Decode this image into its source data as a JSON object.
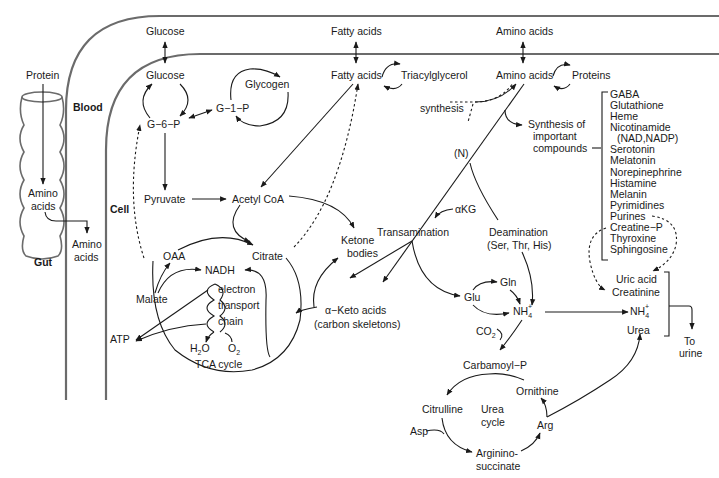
{
  "compartments": {
    "blood": "Blood",
    "cell": "Cell",
    "gut": "Gut"
  },
  "gut": {
    "protein": "Protein",
    "amino_acids_1": "Amino",
    "amino_acids_2": "acids"
  },
  "blood": {
    "glucose": "Glucose",
    "fatty_acids": "Fatty acids",
    "amino_acids": "Amino acids",
    "gut_amino_1": "Amino",
    "gut_amino_2": "acids"
  },
  "carbohydrate": {
    "glucose": "Glucose",
    "glycogen": "Glycogen",
    "g6p": "G−6−P",
    "g1p": "G−1−P",
    "pyruvate": "Pyruvate",
    "acetyl_coa": "Acetyl CoA"
  },
  "lipid": {
    "fatty_acids": "Fatty acids",
    "triacylglycerol": "Triacylglycerol",
    "ketone_1": "Ketone",
    "ketone_2": "bodies"
  },
  "tca": {
    "oaa": "OAA",
    "citrate": "Citrate",
    "nadh": "NADH",
    "malate": "Malate",
    "atp": "ATP",
    "etc_1": "electron",
    "etc_2": "transport",
    "etc_3": "chain",
    "h2o": "H",
    "h2o_sub": "2",
    "h2o_end": "O",
    "o2": "O",
    "o2_sub": "2",
    "cycle_label": "TCA cycle"
  },
  "amino": {
    "amino_acids": "Amino acids",
    "proteins": "Proteins",
    "synthesis": "synthesis",
    "synth_important_1": "Synthesis of",
    "synth_important_2": "important",
    "synth_important_3": "compounds",
    "n_label": "(N)",
    "akg": "αKG",
    "transamination": "Transamination",
    "deamination": "Deamination",
    "deamination_sub": "(Ser, Thr, His)",
    "keto_1": "α−Keto acids",
    "keto_2": "(carbon skeletons)",
    "glu": "Glu",
    "gln": "Gln",
    "nh4": "NH",
    "nh4_sub": "4",
    "nh4_sup": "+",
    "co2": "CO",
    "co2_sub": "2"
  },
  "compounds": [
    "GABA",
    "Glutathione",
    "Heme",
    "Nicotinamide",
    "(NAD,NADP)",
    "Serotonin",
    "Melatonin",
    "Norepinephrine",
    "Histamine",
    "Melanin",
    "Pyrimidines",
    "Purines",
    "Creatine−P",
    "Thyroxine",
    "Sphingosine"
  ],
  "excretion": {
    "uric_acid": "Uric acid",
    "creatinine": "Creatinine",
    "nh4": "NH",
    "nh4_sub": "4",
    "nh4_sup": "+",
    "urea": "Urea",
    "to_urine_1": "To",
    "to_urine_2": "urine"
  },
  "urea_cycle": {
    "carbamoyl_p": "Carbamoyl−P",
    "ornithine": "Ornithine",
    "citrulline": "Citrulline",
    "cycle_1": "Urea",
    "cycle_2": "cycle",
    "asp": "Asp",
    "arg": "Arg",
    "argsucc_1": "Arginino-",
    "argsucc_2": "succinate"
  }
}
